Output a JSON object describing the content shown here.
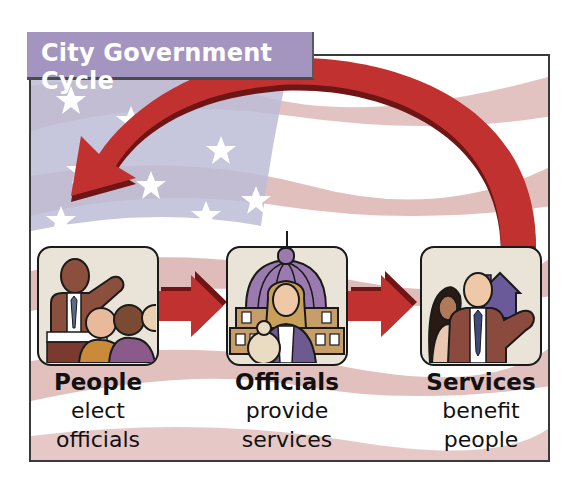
{
  "title": "City Government Cycle",
  "colors": {
    "title_bar": "#a495c0",
    "arrow_red": "#c0312f",
    "arrow_dark": "#6e1515",
    "flag_red": "#d9a9a6",
    "flag_blue": "#b6b6cf"
  },
  "stages": [
    {
      "head": "People",
      "line1": "elect",
      "line2": "officials",
      "icon": "people-at-meeting-icon"
    },
    {
      "head": "Officials",
      "line1": "provide",
      "line2": "services",
      "icon": "official-at-capitol-icon"
    },
    {
      "head": "Services",
      "line1": "benefit",
      "line2": "people",
      "icon": "family-with-house-icon"
    }
  ],
  "arrows": [
    {
      "from": "People",
      "to": "Officials"
    },
    {
      "from": "Officials",
      "to": "Services"
    },
    {
      "from": "Services",
      "to": "People",
      "shape": "curved"
    }
  ]
}
